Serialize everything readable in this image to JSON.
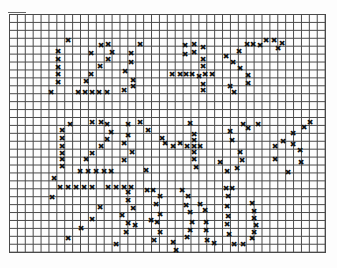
{
  "pattern": {
    "type": "cross-stitch-chart",
    "grid": {
      "left": 9,
      "top": 14,
      "width": 316,
      "height": 238,
      "columns": 40,
      "rows": 30
    },
    "mark_symbol": "cross-mark",
    "mark_color": "#111111",
    "line_color": "#2a2a2a",
    "marks": [
      [
        68,
        40
      ],
      [
        58,
        51
      ],
      [
        58,
        59
      ],
      [
        58,
        67
      ],
      [
        58,
        74
      ],
      [
        58,
        82
      ],
      [
        51,
        92
      ],
      [
        91,
        53
      ],
      [
        101,
        45
      ],
      [
        108,
        44
      ],
      [
        112,
        52
      ],
      [
        108,
        59
      ],
      [
        100,
        66
      ],
      [
        91,
        74
      ],
      [
        86,
        81
      ],
      [
        78,
        92
      ],
      [
        85,
        92
      ],
      [
        92,
        92
      ],
      [
        99,
        92
      ],
      [
        107,
        92
      ],
      [
        131,
        53
      ],
      [
        131,
        62
      ],
      [
        125,
        71
      ],
      [
        133,
        80
      ],
      [
        124,
        90
      ],
      [
        140,
        44
      ],
      [
        133,
        86
      ],
      [
        172,
        74
      ],
      [
        180,
        74
      ],
      [
        186,
        74
      ],
      [
        192,
        74
      ],
      [
        199,
        76
      ],
      [
        205,
        74
      ],
      [
        212,
        74
      ],
      [
        185,
        54
      ],
      [
        194,
        52
      ],
      [
        203,
        47
      ],
      [
        203,
        59
      ],
      [
        203,
        66
      ],
      [
        203,
        84
      ],
      [
        203,
        90
      ],
      [
        185,
        45
      ],
      [
        194,
        44
      ],
      [
        226,
        56
      ],
      [
        239,
        51
      ],
      [
        247,
        44
      ],
      [
        253,
        44
      ],
      [
        260,
        45
      ],
      [
        233,
        62
      ],
      [
        240,
        68
      ],
      [
        248,
        75
      ],
      [
        248,
        83
      ],
      [
        230,
        86
      ],
      [
        234,
        92
      ],
      [
        266,
        40
      ],
      [
        274,
        40
      ],
      [
        282,
        43
      ],
      [
        278,
        48
      ],
      [
        70,
        124
      ],
      [
        62,
        130
      ],
      [
        62,
        138
      ],
      [
        62,
        146
      ],
      [
        62,
        153
      ],
      [
        62,
        159
      ],
      [
        62,
        166
      ],
      [
        54,
        178
      ],
      [
        92,
        122
      ],
      [
        101,
        122
      ],
      [
        107,
        124
      ],
      [
        111,
        132
      ],
      [
        107,
        139
      ],
      [
        101,
        146
      ],
      [
        92,
        153
      ],
      [
        86,
        159
      ],
      [
        80,
        171
      ],
      [
        88,
        171
      ],
      [
        96,
        171
      ],
      [
        104,
        171
      ],
      [
        111,
        171
      ],
      [
        128,
        124
      ],
      [
        128,
        135
      ],
      [
        124,
        143
      ],
      [
        132,
        152
      ],
      [
        124,
        160
      ],
      [
        140,
        122
      ],
      [
        148,
        130
      ],
      [
        146,
        170
      ],
      [
        162,
        138
      ],
      [
        165,
        143
      ],
      [
        173,
        146
      ],
      [
        180,
        143
      ],
      [
        187,
        146
      ],
      [
        194,
        146
      ],
      [
        200,
        146
      ],
      [
        190,
        123
      ],
      [
        194,
        134
      ],
      [
        194,
        140
      ],
      [
        194,
        152
      ],
      [
        194,
        159
      ],
      [
        196,
        167
      ],
      [
        220,
        162
      ],
      [
        227,
        171
      ],
      [
        237,
        168
      ],
      [
        242,
        160
      ],
      [
        240,
        152
      ],
      [
        232,
        140
      ],
      [
        230,
        131
      ],
      [
        243,
        124
      ],
      [
        248,
        128
      ],
      [
        258,
        124
      ],
      [
        275,
        159
      ],
      [
        275,
        146
      ],
      [
        283,
        141
      ],
      [
        293,
        133
      ],
      [
        293,
        144
      ],
      [
        300,
        150
      ],
      [
        301,
        162
      ],
      [
        288,
        172
      ],
      [
        304,
        127
      ],
      [
        310,
        122
      ],
      [
        60,
        187
      ],
      [
        68,
        187
      ],
      [
        76,
        187
      ],
      [
        84,
        187
      ],
      [
        92,
        187
      ],
      [
        52,
        197
      ],
      [
        108,
        187
      ],
      [
        116,
        187
      ],
      [
        124,
        187
      ],
      [
        131,
        187
      ],
      [
        100,
        207
      ],
      [
        92,
        219
      ],
      [
        81,
        228
      ],
      [
        68,
        238
      ],
      [
        128,
        192
      ],
      [
        128,
        200
      ],
      [
        133,
        208
      ],
      [
        122,
        215
      ],
      [
        128,
        223
      ],
      [
        135,
        225
      ],
      [
        126,
        232
      ],
      [
        116,
        244
      ],
      [
        147,
        190
      ],
      [
        153,
        190
      ],
      [
        160,
        196
      ],
      [
        156,
        204
      ],
      [
        160,
        214
      ],
      [
        151,
        220
      ],
      [
        157,
        222
      ],
      [
        160,
        232
      ],
      [
        154,
        240
      ],
      [
        182,
        190
      ],
      [
        188,
        196
      ],
      [
        186,
        205
      ],
      [
        190,
        212
      ],
      [
        192,
        222
      ],
      [
        190,
        230
      ],
      [
        187,
        237
      ],
      [
        173,
        242
      ],
      [
        176,
        250
      ],
      [
        200,
        204
      ],
      [
        205,
        210
      ],
      [
        206,
        222
      ],
      [
        206,
        230
      ],
      [
        207,
        240
      ],
      [
        214,
        243
      ],
      [
        226,
        188
      ],
      [
        232,
        188
      ],
      [
        228,
        196
      ],
      [
        227,
        206
      ],
      [
        228,
        216
      ],
      [
        227,
        224
      ],
      [
        229,
        234
      ],
      [
        234,
        244
      ],
      [
        243,
        244
      ],
      [
        252,
        203
      ],
      [
        254,
        211
      ],
      [
        254,
        218
      ],
      [
        256,
        225
      ],
      [
        254,
        232
      ],
      [
        252,
        238
      ]
    ]
  }
}
